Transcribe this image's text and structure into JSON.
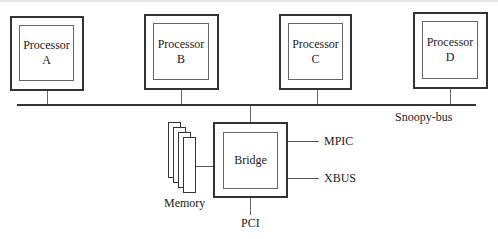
{
  "diagram": {
    "processors": [
      {
        "line1": "Processor",
        "line2": "A"
      },
      {
        "line1": "Processor",
        "line2": "B"
      },
      {
        "line1": "Processor",
        "line2": "C"
      },
      {
        "line1": "Processor",
        "line2": "D"
      }
    ],
    "bus_label": "Snoopy-bus",
    "bridge_label": "Bridge",
    "memory_label": "Memory",
    "mpic_label": "MPIC",
    "xbus_label": "XBUS",
    "pci_label": "PCI"
  }
}
